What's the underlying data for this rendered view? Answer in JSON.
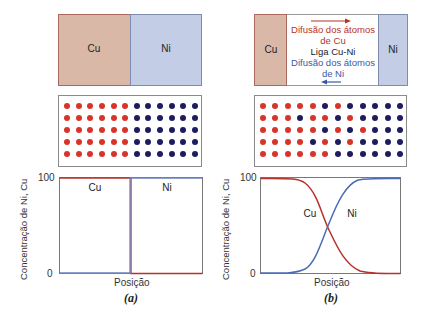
{
  "panels": {
    "a": {
      "label": "(a)",
      "couple": {
        "left_label": "Cu",
        "right_label": "Ni"
      },
      "lattice": {
        "rows": [
          "RRRRRRBBBBBB",
          "RRRRRRBBBBBB",
          "RRRRRRBBBBBB",
          "RRRRRRBBBBBB",
          "RRRRRRBBBBBB"
        ]
      },
      "graph": {
        "y_axis_label": "Concentração de Ni, Cu",
        "y_tick_top": "100",
        "y_tick_bottom": "0",
        "x_axis_label": "Posição",
        "curve_label_cu": "Cu",
        "curve_label_ni": "Ni"
      }
    },
    "b": {
      "label": "(b)",
      "couple": {
        "left_label": "Cu",
        "right_label": "Ni",
        "cu_diffusion_line1": "Difusão dos átomos",
        "cu_diffusion_line2": "de Cu",
        "alloy_label": "Liga Cu-Ni",
        "ni_diffusion_line1": "Difusão dos átomos",
        "ni_diffusion_line2": "de Ni"
      },
      "lattice": {
        "rows": [
          "RRRRRBRBBBBB",
          "RRRBRRBRBBBB",
          "RRRRRBRBRBBB",
          "RRRRBRBRBBBB",
          "RRRRRRBBBBBB"
        ]
      },
      "graph": {
        "y_axis_label": "Concentração de Ni, Cu",
        "y_tick_top": "100",
        "y_tick_bottom": "0",
        "x_axis_label": "Posição",
        "curve_label_cu": "Cu",
        "curve_label_ni": "Ni"
      }
    }
  },
  "colors": {
    "cu": "#d8342a",
    "ni": "#1d1c5e",
    "cu_block": "#d9b8a8",
    "ni_block": "#c3cde6",
    "cu_curve": "#b5332a",
    "ni_curve": "#4a6bb5"
  },
  "chart_data": [
    {
      "type": "line",
      "title": "(a)",
      "xlabel": "Posição",
      "ylabel": "Concentração de Ni, Cu",
      "ylim": [
        0,
        100
      ],
      "x": [
        0,
        0.5,
        0.5,
        1
      ],
      "series": [
        {
          "name": "Cu",
          "values": [
            100,
            100,
            0,
            0
          ]
        },
        {
          "name": "Ni",
          "values": [
            0,
            0,
            100,
            100
          ]
        }
      ]
    },
    {
      "type": "line",
      "title": "(b)",
      "xlabel": "Posição",
      "ylabel": "Concentração de Ni, Cu",
      "ylim": [
        0,
        100
      ],
      "x": [
        0,
        0.2,
        0.3,
        0.4,
        0.5,
        0.6,
        0.7,
        0.8,
        1
      ],
      "series": [
        {
          "name": "Cu",
          "values": [
            100,
            99,
            93,
            75,
            45,
            20,
            6,
            1,
            0
          ]
        },
        {
          "name": "Ni",
          "values": [
            0,
            1,
            7,
            25,
            55,
            80,
            94,
            99,
            100
          ]
        }
      ]
    }
  ]
}
